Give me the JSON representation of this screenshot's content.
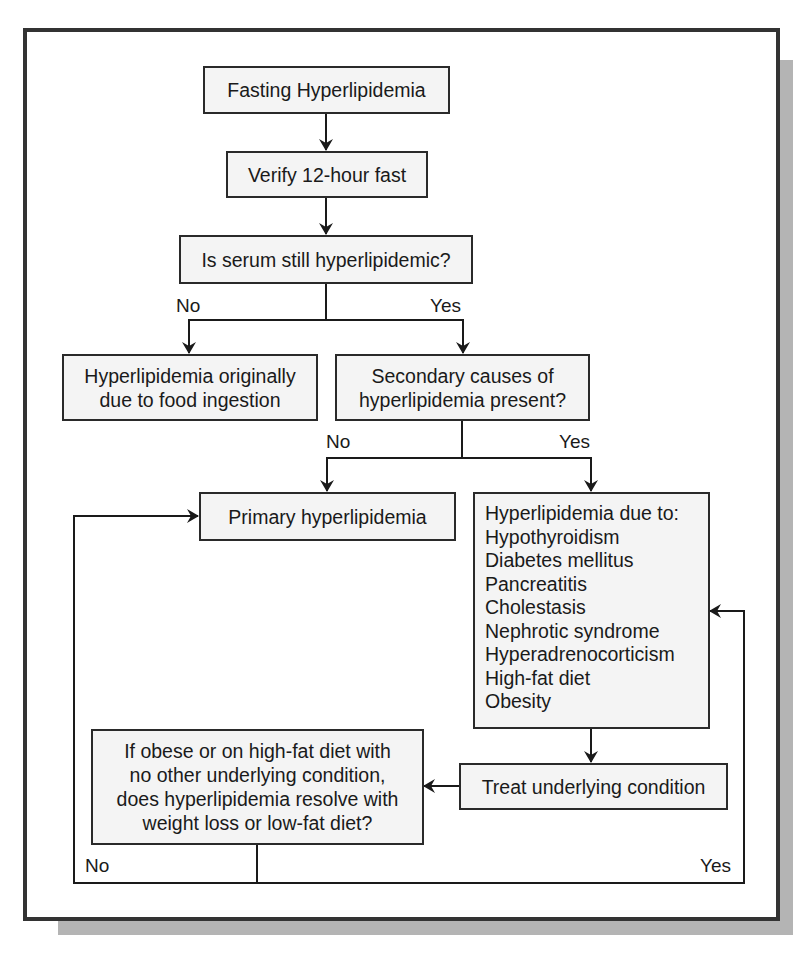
{
  "diagram": {
    "type": "flowchart",
    "nodes": {
      "fasting": "Fasting Hyperlipidemia",
      "verify": "Verify 12-hour fast",
      "still": "Is serum still hyperlipidemic?",
      "food": [
        "Hyperlipidemia originally",
        "due to food ingestion"
      ],
      "secondary": [
        "Secondary causes of",
        "hyperlipidemia present?"
      ],
      "primary": "Primary hyperlipidemia",
      "causes": {
        "heading": "Hyperlipidemia due to:",
        "items": [
          "Hypothyroidism",
          "Diabetes mellitus",
          "Pancreatitis",
          "Cholestasis",
          "Nephrotic syndrome",
          "Hyperadrenocorticism",
          "High-fat diet",
          "Obesity"
        ]
      },
      "treat": "Treat underlying condition",
      "resolve": [
        "If obese or on high-fat diet with",
        "no other underlying condition,",
        "does hyperlipidemia resolve with",
        "weight loss or low-fat diet?"
      ]
    },
    "labels": {
      "still_no": "No",
      "still_yes": "Yes",
      "secondary_no": "No",
      "secondary_yes": "Yes",
      "resolve_no": "No",
      "resolve_yes": "Yes"
    },
    "edges": [
      {
        "from": "fasting",
        "to": "verify"
      },
      {
        "from": "verify",
        "to": "still"
      },
      {
        "from": "still",
        "to": "food",
        "label": "No"
      },
      {
        "from": "still",
        "to": "secondary",
        "label": "Yes"
      },
      {
        "from": "secondary",
        "to": "primary",
        "label": "No"
      },
      {
        "from": "secondary",
        "to": "causes",
        "label": "Yes"
      },
      {
        "from": "causes",
        "to": "treat"
      },
      {
        "from": "treat",
        "to": "resolve"
      },
      {
        "from": "resolve",
        "to": "primary",
        "label": "No"
      },
      {
        "from": "resolve",
        "to": "causes",
        "label": "Yes"
      }
    ]
  }
}
